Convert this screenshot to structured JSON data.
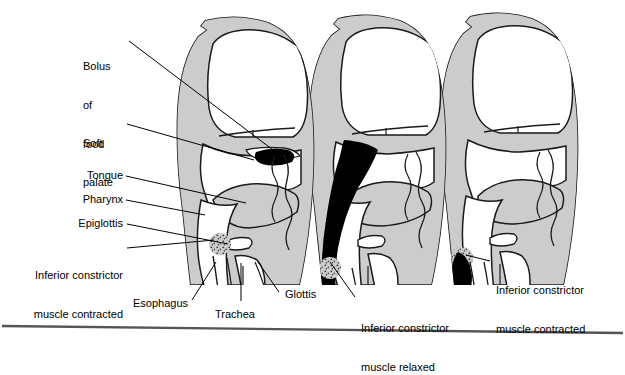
{
  "figure": {
    "type": "anatomical-diagram",
    "stages": 3,
    "background_color": "#ffffff",
    "head_fill_color": "#cccccc",
    "cavity_fill_color": "#ffffff",
    "bolus_color": "#000000",
    "outline_color": "#1a1a1a",
    "rule_color": "#555555"
  },
  "labels": {
    "bolus_of_food": {
      "lines": [
        "Bolus",
        "of",
        "food"
      ],
      "line1": "Bolus",
      "line2": "of",
      "line3": "food",
      "align": "left"
    },
    "soft_palate": {
      "lines": [
        "Soft",
        "palate"
      ],
      "line1": "Soft",
      "line2": "palate",
      "align": "left"
    },
    "tongue": {
      "text": "Tongue",
      "align": "right"
    },
    "pharynx": {
      "text": "Pharynx",
      "align": "right"
    },
    "epiglottis": {
      "text": "Epiglottis",
      "align": "right"
    },
    "inferior_constrictor_contracted_left": {
      "lines": [
        "Inferior constrictor",
        "muscle contracted"
      ],
      "line1": "Inferior constrictor",
      "line2": "muscle contracted",
      "align": "right"
    },
    "esophagus": {
      "text": "Esophagus",
      "align": "right"
    },
    "trachea": {
      "text": "Trachea",
      "align": "center"
    },
    "glottis": {
      "text": "Glottis",
      "align": "left"
    },
    "inferior_constrictor_relaxed": {
      "lines": [
        "Inferior constrictor",
        "muscle relaxed"
      ],
      "line1": "Inferior constrictor",
      "line2": "muscle relaxed",
      "align": "left"
    },
    "inferior_constrictor_contracted_right": {
      "lines": [
        "Inferior constrictor",
        "muscle contracted"
      ],
      "line1": "Inferior constrictor",
      "line2": "muscle contracted",
      "align": "left"
    }
  }
}
